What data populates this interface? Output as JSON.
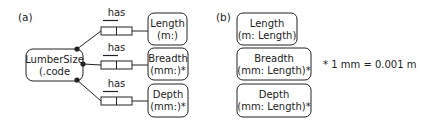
{
  "panel_a": {
    "label": "(a)",
    "entity": {
      "line1": "LumberSize",
      "line2": "(.code"
    },
    "roles": [
      {
        "predicate": "has",
        "target": {
          "line1": "Length",
          "line2": "(m:)"
        }
      },
      {
        "predicate": "has",
        "target": {
          "line1": "Breadth",
          "line2": "(mm:)*"
        }
      },
      {
        "predicate": "has",
        "target": {
          "line1": "Depth",
          "line2": "(mm:)*"
        }
      }
    ]
  },
  "panel_b": {
    "label": "(b)",
    "boxes": [
      {
        "line1": "Length",
        "line2": "(m: Length)"
      },
      {
        "line1": "Breadth",
        "line2": "(mm: Length)*"
      },
      {
        "line1": "Depth",
        "line2": "(mm: Length)*"
      }
    ],
    "note": "* 1 mm = 0.001 m"
  },
  "colors": {
    "stroke": "#222222",
    "background": "#ffffff"
  }
}
